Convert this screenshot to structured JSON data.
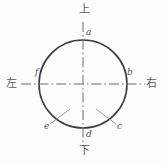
{
  "figure": {
    "type": "technical-drawing",
    "background_color": "#fdfdfd",
    "stroke_color": "#3d3d3d",
    "centerline_color": "#6b6b6b",
    "leader_color": "#8a8a8a",
    "text_color": "#4f4f4f"
  },
  "circle": {
    "center_x": 83,
    "center_y": 84,
    "radius": 44
  },
  "direction_labels": {
    "top": "上",
    "bottom": "下",
    "left": "左",
    "right": "右"
  },
  "point_labels": {
    "a": "a",
    "b": "b",
    "c": "c",
    "d": "d",
    "e": "e",
    "f": "f"
  },
  "centerlines": {
    "vertical": {
      "x": 83,
      "y1": 22,
      "y2": 146
    },
    "horizontal": {
      "y": 84,
      "x1": 21,
      "x2": 145
    }
  },
  "leaders": [
    {
      "name": "leader-e",
      "x1": 70,
      "y1": 109,
      "x2": 50,
      "y2": 124
    },
    {
      "name": "leader-c",
      "x1": 96,
      "y1": 109,
      "x2": 116,
      "y2": 124
    }
  ]
}
